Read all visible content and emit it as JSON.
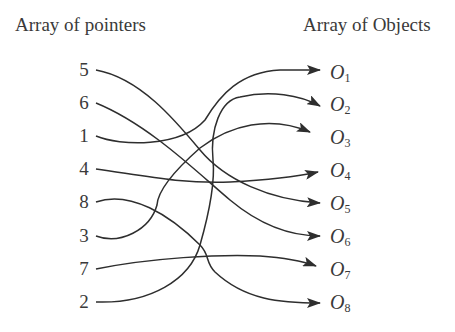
{
  "headings": {
    "left": "Array of pointers",
    "right": "Array of Objects"
  },
  "pointers": [
    {
      "label": "5",
      "y": 70,
      "target": "O5"
    },
    {
      "label": "6",
      "y": 103,
      "target": "O6"
    },
    {
      "label": "1",
      "y": 136,
      "target": "O1"
    },
    {
      "label": "4",
      "y": 169,
      "target": "O4"
    },
    {
      "label": "8",
      "y": 202,
      "target": "O8"
    },
    {
      "label": "3",
      "y": 236,
      "target": "O3"
    },
    {
      "label": "7",
      "y": 269,
      "target": "O7"
    },
    {
      "label": "2",
      "y": 302,
      "target": "O2"
    }
  ],
  "objects": [
    {
      "letter": "O",
      "sub": "1",
      "y": 72
    },
    {
      "letter": "O",
      "sub": "2",
      "y": 104
    },
    {
      "letter": "O",
      "sub": "3",
      "y": 137
    },
    {
      "letter": "O",
      "sub": "4",
      "y": 170
    },
    {
      "letter": "O",
      "sub": "5",
      "y": 203
    },
    {
      "letter": "O",
      "sub": "6",
      "y": 236
    },
    {
      "letter": "O",
      "sub": "7",
      "y": 269
    },
    {
      "letter": "O",
      "sub": "8",
      "y": 302
    }
  ],
  "colors": {
    "line": "#2e2e2e",
    "text": "#3a3a3a",
    "background": "#ffffff"
  }
}
